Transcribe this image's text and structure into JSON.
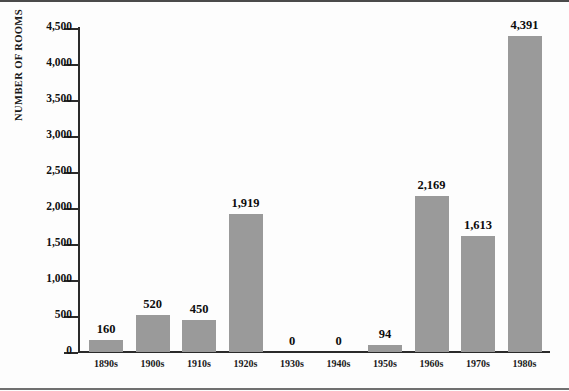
{
  "chart_data": {
    "type": "bar",
    "title": "",
    "xlabel": "",
    "ylabel": "NUMBER OF ROOMS",
    "categories": [
      "1890s",
      "1900s",
      "1910s",
      "1920s",
      "1930s",
      "1940s",
      "1950s",
      "1960s",
      "1970s",
      "1980s"
    ],
    "values": [
      160,
      520,
      450,
      1919,
      0,
      0,
      94,
      2169,
      1613,
      4391
    ],
    "value_labels": [
      "160",
      "520",
      "450",
      "1,919",
      "0",
      "0",
      "94",
      "2,169",
      "1,613",
      "4,391"
    ],
    "ylim": [
      0,
      4500
    ],
    "ytick_values": [
      0,
      500,
      1000,
      1500,
      2000,
      2500,
      3000,
      3500,
      4000,
      4500
    ],
    "ytick_labels": [
      "0",
      "500",
      "1,000",
      "1,500",
      "2,000",
      "2,500",
      "3,000",
      "3,500",
      "4,000",
      "4,500"
    ],
    "grid": false,
    "legend": false,
    "bar_color": "#9a9a9a",
    "axis_color": "#2b2b2b",
    "background_color": "#fdfdfd"
  }
}
